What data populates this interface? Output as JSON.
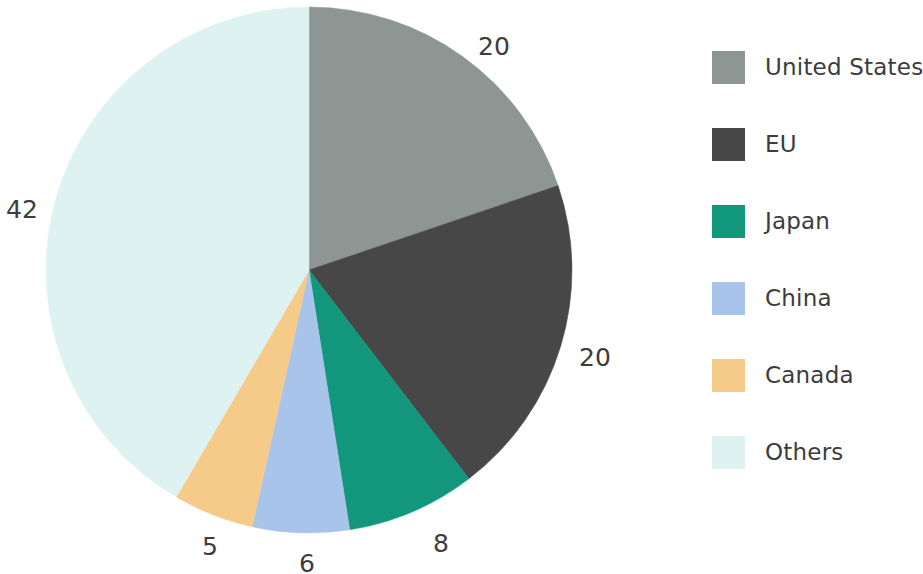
{
  "chart_data": {
    "type": "pie",
    "title": "",
    "subtitle": "",
    "xlabel": "",
    "ylabel": "",
    "grid": false,
    "legend_position": "right",
    "start_angle_deg": 0,
    "direction": "clockwise",
    "total": 101,
    "categories": [
      "United States",
      "EU",
      "Japan",
      "China",
      "Canada",
      "Others"
    ],
    "values": [
      20,
      20,
      8,
      6,
      5,
      42
    ],
    "colors": [
      "#8d9693",
      "#474747",
      "#12967c",
      "#a8c4ea",
      "#f6cb8a",
      "#dff2f2"
    ],
    "slices": [
      {
        "label": "United States",
        "value": 20,
        "value_text": "20",
        "color": "#8d9693",
        "label_x": 494,
        "label_y": 46
      },
      {
        "label": "EU",
        "value": 20,
        "value_text": "20",
        "color": "#474747",
        "label_x": 595,
        "label_y": 357
      },
      {
        "label": "Japan",
        "value": 8,
        "value_text": "8",
        "color": "#12967c",
        "label_x": 441,
        "label_y": 543
      },
      {
        "label": "China",
        "value": 6,
        "value_text": "6",
        "color": "#a8c4ea",
        "label_x": 307,
        "label_y": 563
      },
      {
        "label": "Canada",
        "value": 5,
        "value_text": "5",
        "color": "#f6cb8a",
        "label_x": 210,
        "label_y": 546
      },
      {
        "label": "Others",
        "value": 42,
        "value_text": "42",
        "color": "#dff2f2",
        "label_x": 22,
        "label_y": 209
      }
    ]
  },
  "legend": {
    "items": [
      {
        "label": "United States",
        "color": "#8d9693"
      },
      {
        "label": "EU",
        "color": "#474747"
      },
      {
        "label": "Japan",
        "color": "#12967c"
      },
      {
        "label": "China",
        "color": "#a8c4ea"
      },
      {
        "label": "Canada",
        "color": "#f6cb8a"
      },
      {
        "label": "Others",
        "color": "#dff2f2"
      }
    ]
  },
  "geometry": {
    "center_x": 309,
    "center_y": 270,
    "radius": 263
  }
}
